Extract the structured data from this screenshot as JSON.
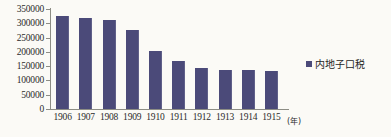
{
  "chart_data": {
    "type": "bar",
    "title": "",
    "subtitle": "",
    "xlabel": "(年)",
    "ylabel": "",
    "categories": [
      "1906",
      "1907",
      "1908",
      "1909",
      "1910",
      "1911",
      "1912",
      "1913",
      "1914",
      "1915"
    ],
    "values": [
      325000,
      318000,
      310000,
      276000,
      203000,
      169000,
      145000,
      138000,
      137000,
      132000
    ],
    "series": [
      {
        "name": "内地子口税",
        "values": [
          325000,
          318000,
          310000,
          276000,
          203000,
          169000,
          145000,
          138000,
          137000,
          132000
        ],
        "color": "#4b4a79"
      }
    ],
    "ylim": [
      0,
      350000
    ],
    "ytick_labels": [
      "350000",
      "300000",
      "250000",
      "200000",
      "150000",
      "100000",
      "50000",
      "0"
    ],
    "ytick_values": [
      350000,
      300000,
      250000,
      200000,
      150000,
      100000,
      50000,
      0
    ],
    "grid": false,
    "legend_position": "right",
    "legend": [
      {
        "label": "内地子口税",
        "color": "#4b4a79"
      }
    ]
  },
  "colors": {
    "bar": "#4b4a79",
    "axis": "#8d8d85",
    "text": "#2b2b2b",
    "background": "#fbfaf6"
  }
}
